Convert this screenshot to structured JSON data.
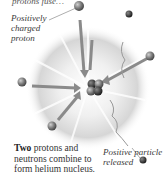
{
  "diagram": {
    "title_fragment": "protons fuse…",
    "labels": {
      "proton": "Positively charged proton",
      "released": "Positive particle released"
    },
    "caption": {
      "lead": "Two",
      "rest": "protons and neutrons combine to form helium nucleus."
    },
    "colors": {
      "burst": "#d8d8d8",
      "particle": "#7a7a7a",
      "nucleus_dark": "#3a3a3a",
      "arrow": "#8a8a8a"
    }
  }
}
